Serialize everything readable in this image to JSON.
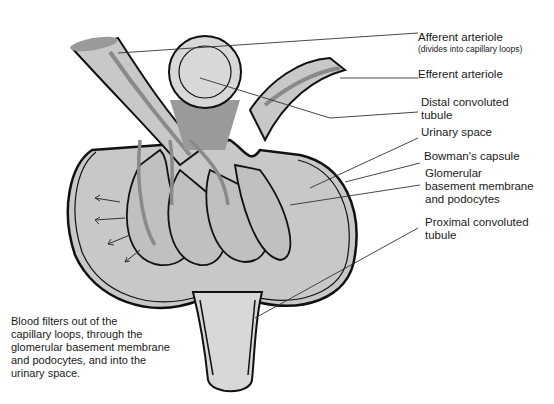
{
  "diagram": {
    "colors": {
      "tissue_gray": "#c8c8c8",
      "light_gray": "#d8d8d8",
      "dark_gray": "#8a8a8a",
      "outline": "#111111",
      "background": "#ffffff"
    },
    "labels": [
      {
        "id": "afferent",
        "text": "Afferent arteriole",
        "sub": "(divides into capillary loops)"
      },
      {
        "id": "efferent",
        "text": "Efferent arteriole"
      },
      {
        "id": "distal",
        "text": "Distal convoluted\ntubule"
      },
      {
        "id": "urinary",
        "text": "Urinary space"
      },
      {
        "id": "bowman",
        "text": "Bowman's capsule"
      },
      {
        "id": "gbm",
        "text": "Glomerular\nbasement membrane\nand podocytes"
      },
      {
        "id": "proximal",
        "text": "Proximal convoluted\ntubule"
      }
    ],
    "caption": "Blood filters out of the\ncapillary loops, through the\nglomerular basement membrane\nand podocytes, and into the\nurinary space."
  }
}
